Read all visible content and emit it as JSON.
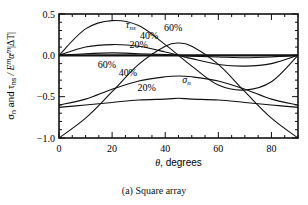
{
  "chart_data": {
    "type": "line",
    "title": "",
    "caption": "(a) Square array",
    "xlabel": "θ, degrees",
    "ylabel": "σn and τns / E^m α^m |ΔT|",
    "xlim": [
      0,
      90
    ],
    "ylim": [
      -1.0,
      0.5
    ],
    "xticks": [
      "0",
      "20",
      "40",
      "60",
      "80"
    ],
    "yticks": [
      "0.5",
      "0.0",
      "-0.5",
      "-1.0"
    ],
    "grid": false,
    "x": [
      0,
      10,
      20,
      30,
      40,
      45,
      50,
      60,
      70,
      80,
      90
    ],
    "series": [
      {
        "name": "τns 60%",
        "values": [
          0.0,
          0.32,
          0.42,
          0.36,
          0.13,
          0.0,
          -0.13,
          -0.36,
          -0.42,
          -0.32,
          0.0
        ]
      },
      {
        "name": "τns 40%",
        "values": [
          0.0,
          0.1,
          0.13,
          0.11,
          0.04,
          0.0,
          -0.04,
          -0.11,
          -0.13,
          -0.1,
          0.0
        ]
      },
      {
        "name": "τns 20%",
        "values": [
          0.0,
          0.02,
          0.03,
          0.02,
          0.01,
          0.0,
          -0.01,
          -0.02,
          -0.03,
          -0.02,
          0.0
        ]
      },
      {
        "name": "σn 60%",
        "values": [
          -1.0,
          -0.76,
          -0.44,
          -0.11,
          0.11,
          0.15,
          0.11,
          -0.11,
          -0.44,
          -0.76,
          -1.0
        ]
      },
      {
        "name": "σn 40%",
        "values": [
          -0.6,
          -0.53,
          -0.41,
          -0.31,
          -0.26,
          -0.25,
          -0.26,
          -0.31,
          -0.41,
          -0.53,
          -0.6
        ]
      },
      {
        "name": "σn 20%",
        "values": [
          -0.63,
          -0.6,
          -0.57,
          -0.54,
          -0.53,
          -0.52,
          -0.53,
          -0.54,
          -0.57,
          -0.6,
          -0.63
        ]
      }
    ],
    "annotations": [
      {
        "text": "τns",
        "x": 27,
        "y": 0.33
      },
      {
        "text": "60%",
        "x": 43,
        "y": 0.3
      },
      {
        "text": "40%",
        "x": 34,
        "y": 0.2
      },
      {
        "text": "20%",
        "x": 30,
        "y": 0.09
      },
      {
        "text": "60%",
        "x": 18,
        "y": -0.15
      },
      {
        "text": "40%",
        "x": 26,
        "y": -0.25
      },
      {
        "text": "σn",
        "x": 48,
        "y": -0.33
      },
      {
        "text": "20%",
        "x": 33,
        "y": -0.43
      }
    ]
  },
  "labels": {
    "ylabel_main": "σ",
    "ylabel_sub_n": "n",
    "ylabel_and": " and τ",
    "ylabel_sub_ns": "ns",
    "ylabel_rest": " / E",
    "ylabel_m1": "m",
    "ylabel_alpha": "α",
    "ylabel_m2": "m",
    "ylabel_end": "|ΔT|"
  }
}
